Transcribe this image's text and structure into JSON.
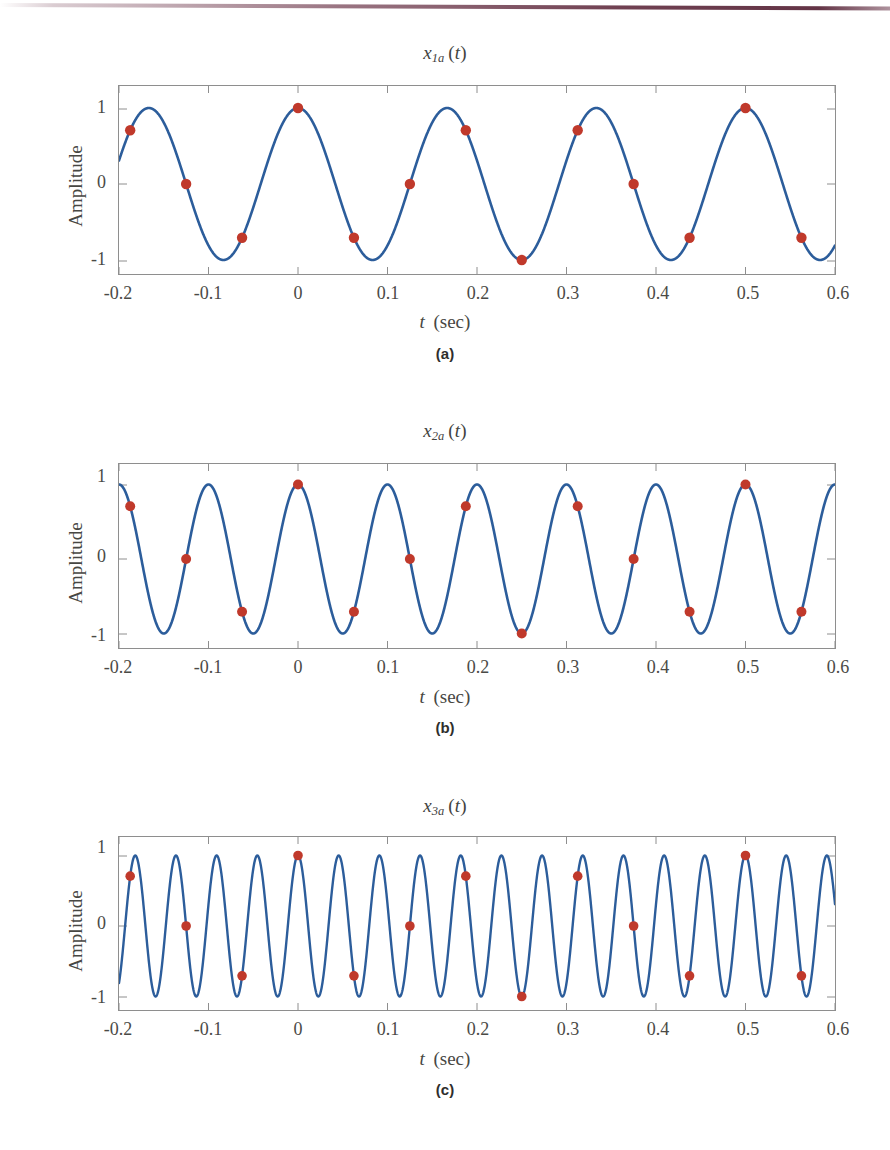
{
  "figure": {
    "background_color": "#ffffff",
    "curve_color": "#2c5d9b",
    "sample_color": "#c0392b",
    "frame_color": "#8e8e8e",
    "top_rule_color": "#6d3a4c",
    "axis_label_y": "Amplitude",
    "axis_label_x_symbol": "t",
    "axis_label_x_unit": "(sec)",
    "x_ticks": [
      "-0.2",
      "-0.1",
      "0",
      "0.1",
      "0.2",
      "0.3",
      "0.4",
      "0.5",
      "0.6"
    ],
    "x_tick_values": [
      -0.2,
      -0.1,
      0,
      0.1,
      0.2,
      0.3,
      0.4,
      0.5,
      0.6
    ],
    "y_ticks": [
      "1",
      "0",
      "-1"
    ],
    "y_tick_values": [
      1,
      0,
      -1
    ]
  },
  "panels": [
    {
      "caption": "(a)",
      "title_symbol": "x",
      "title_sub": "1a",
      "title_arg": "(t)",
      "title_plain": "x1a (t)"
    },
    {
      "caption": "(b)",
      "title_symbol": "x",
      "title_sub": "2a",
      "title_arg": "(t)",
      "title_plain": "x2a (t)"
    },
    {
      "caption": "(c)",
      "title_symbol": "x",
      "title_sub": "3a",
      "title_arg": "(t)",
      "title_plain": "x3a (t)"
    }
  ],
  "chart_data": [
    {
      "type": "line",
      "title": "x1a (t)",
      "xlabel": "t (sec)",
      "ylabel": "Amplitude",
      "xlim": [
        -0.2,
        0.6
      ],
      "ylim": [
        -1.18,
        1.18
      ],
      "grid": false,
      "legend": "none",
      "xticks": [
        -0.2,
        -0.1,
        0,
        0.1,
        0.2,
        0.3,
        0.4,
        0.5,
        0.6
      ],
      "yticks": [
        -1,
        0,
        1
      ],
      "series": [
        {
          "name": "x1a(t) = cos(2*pi*6*t)",
          "kind": "continuous",
          "color": "#2c5d9b",
          "amplitude": 1,
          "frequency_hz": 6,
          "phase_rad": 0
        },
        {
          "name": "samples at fs = 16 Hz",
          "kind": "markers",
          "color": "#c0392b",
          "sample_rate_hz": 16,
          "x": [
            -0.1875,
            -0.125,
            -0.0625,
            0,
            0.0625,
            0.125,
            0.1875,
            0.25,
            0.3125,
            0.375,
            0.4375,
            0.5,
            0.5625
          ],
          "y": [
            0.7071,
            0.0,
            -0.7071,
            1.0,
            -0.7071,
            0.0,
            0.7071,
            -1.0,
            0.7071,
            0.0,
            -0.7071,
            1.0,
            -0.7071
          ]
        }
      ]
    },
    {
      "type": "line",
      "title": "x2a (t)",
      "xlabel": "t (sec)",
      "ylabel": "Amplitude",
      "xlim": [
        -0.2,
        0.6
      ],
      "ylim": [
        -1.18,
        1.18
      ],
      "grid": false,
      "legend": "none",
      "xticks": [
        -0.2,
        -0.1,
        0,
        0.1,
        0.2,
        0.3,
        0.4,
        0.5,
        0.6
      ],
      "yticks": [
        -1,
        0,
        1
      ],
      "series": [
        {
          "name": "x2a(t) = cos(2*pi*10*t)",
          "kind": "continuous",
          "color": "#2c5d9b",
          "amplitude": 1,
          "frequency_hz": 10,
          "phase_rad": 0
        },
        {
          "name": "samples at fs = 16 Hz",
          "kind": "markers",
          "color": "#c0392b",
          "sample_rate_hz": 16,
          "x": [
            -0.1875,
            -0.125,
            -0.0625,
            0,
            0.0625,
            0.125,
            0.1875,
            0.25,
            0.3125,
            0.375,
            0.4375,
            0.5,
            0.5625
          ],
          "y": [
            0.7071,
            0.0,
            -0.7071,
            1.0,
            -0.7071,
            0.0,
            0.7071,
            -1.0,
            0.7071,
            0.0,
            -0.7071,
            1.0,
            -0.7071
          ]
        }
      ]
    },
    {
      "type": "line",
      "title": "x3a (t)",
      "xlabel": "t (sec)",
      "ylabel": "Amplitude",
      "xlim": [
        -0.2,
        0.6
      ],
      "ylim": [
        -1.18,
        1.18
      ],
      "grid": false,
      "legend": "none",
      "xticks": [
        -0.2,
        -0.1,
        0,
        0.1,
        0.2,
        0.3,
        0.4,
        0.5,
        0.6
      ],
      "yticks": [
        -1,
        0,
        1
      ],
      "series": [
        {
          "name": "x3a(t) = cos(2*pi*22*t)",
          "kind": "continuous",
          "color": "#2c5d9b",
          "amplitude": 1,
          "frequency_hz": 22,
          "phase_rad": 0
        },
        {
          "name": "samples at fs = 16 Hz",
          "kind": "markers",
          "color": "#c0392b",
          "sample_rate_hz": 16,
          "x": [
            -0.1875,
            -0.125,
            -0.0625,
            0,
            0.0625,
            0.125,
            0.1875,
            0.25,
            0.3125,
            0.375,
            0.4375,
            0.5,
            0.5625
          ],
          "y": [
            0.7071,
            0.0,
            -0.7071,
            1.0,
            -0.7071,
            0.0,
            0.7071,
            -1.0,
            0.7071,
            0.0,
            -0.7071,
            1.0,
            -0.7071
          ]
        }
      ]
    }
  ]
}
